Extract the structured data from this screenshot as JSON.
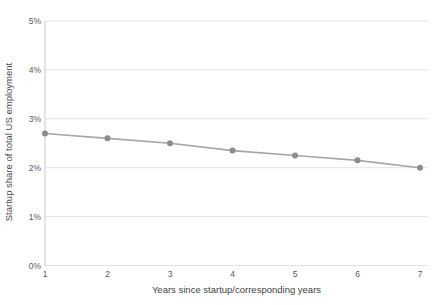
{
  "chart_data": {
    "type": "line",
    "x": [
      1,
      2,
      3,
      4,
      5,
      6,
      7
    ],
    "values": [
      2.7,
      2.6,
      2.5,
      2.35,
      2.25,
      2.15,
      2.0
    ],
    "x_ticks": [
      "1",
      "2",
      "3",
      "4",
      "5",
      "6",
      "7"
    ],
    "y_ticks": [
      "0%",
      "1%",
      "2%",
      "3%",
      "4%",
      "5%"
    ],
    "y_tick_values": [
      0,
      1,
      2,
      3,
      4,
      5
    ],
    "title": "",
    "xlabel": "Years since startup/corresponding years",
    "ylabel": "Startup share of total US employment",
    "xlim": [
      1,
      7
    ],
    "ylim": [
      0,
      5
    ],
    "grid": "horizontal",
    "legend": "none",
    "colors": {
      "background": "#ffffff",
      "line": "#a6a6a6",
      "marker": "#8c8c8c",
      "gridline": "#e3e3e3",
      "axis_spine": "#c9c9c9",
      "tick_text": "#595959",
      "axis_title_text": "#454545"
    }
  }
}
